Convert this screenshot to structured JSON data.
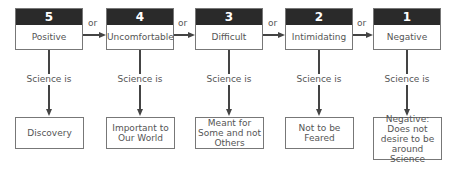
{
  "connector_label": "or",
  "link_label": "Science is",
  "colors": {
    "header_bg": "#2a2a2a",
    "header_text": "#ffffff",
    "line": "#444444",
    "border": "#777777"
  },
  "columns": [
    {
      "rank": "5",
      "attitude": "Positive",
      "science_is": "Discovery"
    },
    {
      "rank": "4",
      "attitude": "Uncomfortable",
      "science_is": "Important to Our World"
    },
    {
      "rank": "3",
      "attitude": "Difficult",
      "science_is": "Meant for Some and not Others"
    },
    {
      "rank": "2",
      "attitude": "Intimidating",
      "science_is": "Not to be Feared"
    },
    {
      "rank": "1",
      "attitude": "Negative",
      "science_is": "Negative: Does not desire to be around Science"
    }
  ]
}
